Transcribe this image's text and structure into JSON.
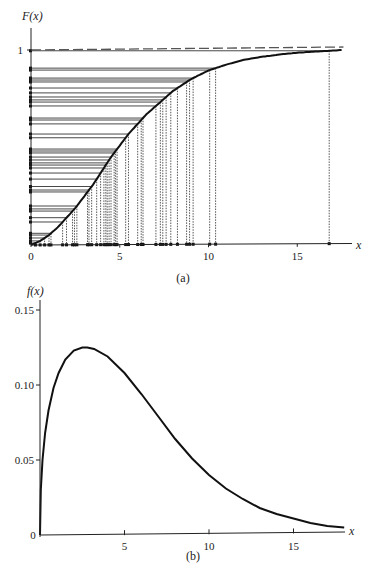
{
  "chart_data": [
    {
      "type": "line",
      "panel": "a",
      "caption": "(a)",
      "ylabel": "F(x)",
      "xlabel": "x",
      "xlim": [
        0,
        18
      ],
      "ylim": [
        0,
        1.05
      ],
      "xticks": [
        0,
        5,
        10,
        15
      ],
      "xtick_labels": [
        "0",
        "5",
        "10",
        "15"
      ],
      "yticks": [
        1
      ],
      "ytick_labels": [
        "1"
      ],
      "asymptote": 1,
      "curve": {
        "name": "F(x)",
        "x": [
          0,
          0.5,
          1,
          1.5,
          2,
          2.5,
          3,
          3.5,
          4,
          4.5,
          5,
          5.5,
          6,
          6.5,
          7,
          7.5,
          8,
          9,
          10,
          11,
          12,
          13,
          14,
          15,
          16,
          17,
          17.5
        ],
        "y": [
          0,
          0.02,
          0.05,
          0.09,
          0.14,
          0.19,
          0.25,
          0.31,
          0.38,
          0.45,
          0.51,
          0.57,
          0.62,
          0.67,
          0.71,
          0.75,
          0.79,
          0.85,
          0.895,
          0.925,
          0.95,
          0.965,
          0.977,
          0.986,
          0.992,
          0.997,
          1.0
        ]
      },
      "samples_u": [
        0.907,
        0.897,
        0.856,
        0.846,
        0.836,
        0.805,
        0.759,
        0.744,
        0.733,
        0.713,
        0.651,
        0.641,
        0.621,
        0.569,
        0.492,
        0.482,
        0.472,
        0.451,
        0.436,
        0.421,
        0.41,
        0.395,
        0.369,
        0.338,
        0.282,
        0.272,
        0.185,
        0.174,
        0.118,
        0.051,
        0.036,
        0.021,
        0.01,
        0.06,
        0.14,
        0.2,
        0.3,
        0.55,
        0.78,
        0.996
      ]
    },
    {
      "type": "line",
      "panel": "b",
      "caption": "(b)",
      "ylabel": "f(x)",
      "xlabel": "x",
      "xlim": [
        0,
        18
      ],
      "ylim": [
        0,
        0.155
      ],
      "xticks": [
        0,
        5,
        10,
        15
      ],
      "xtick_labels": [
        "0",
        "5",
        "10",
        "15"
      ],
      "yticks": [
        0.05,
        0.1,
        0.15
      ],
      "ytick_labels": [
        "0.05",
        "0.10",
        "0.15"
      ],
      "curve": {
        "name": "f(x)",
        "x": [
          0,
          0.05,
          0.15,
          0.3,
          0.5,
          0.8,
          1.1,
          1.5,
          2,
          2.5,
          2.8,
          3.2,
          4,
          5,
          6,
          7,
          8,
          9,
          10,
          11,
          12,
          13,
          14,
          15,
          16,
          17,
          18
        ],
        "y": [
          0,
          0.03,
          0.05,
          0.068,
          0.083,
          0.098,
          0.108,
          0.117,
          0.123,
          0.125,
          0.125,
          0.124,
          0.119,
          0.108,
          0.094,
          0.079,
          0.064,
          0.051,
          0.04,
          0.031,
          0.024,
          0.018,
          0.014,
          0.011,
          0.008,
          0.006,
          0.005
        ]
      }
    }
  ]
}
